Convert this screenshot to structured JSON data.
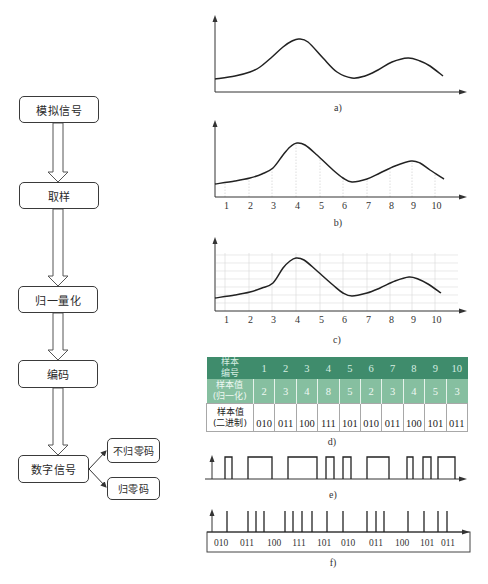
{
  "flowchart": {
    "steps": [
      {
        "label": "模拟信号"
      },
      {
        "label": "取样"
      },
      {
        "label": "归一量化"
      },
      {
        "label": "编码"
      },
      {
        "label": "数字信号"
      }
    ],
    "outputs": [
      {
        "label": "不归零码"
      },
      {
        "label": "归零码"
      }
    ]
  },
  "chart_data": [
    {
      "id": "a",
      "type": "line",
      "caption": "a)",
      "axes": {
        "origin": [
          215,
          92
        ],
        "y_top": 15,
        "x_end": 467
      },
      "curve": [
        [
          215,
          79
        ],
        [
          235,
          76
        ],
        [
          250,
          72
        ],
        [
          260,
          67
        ],
        [
          272,
          57
        ],
        [
          283,
          47
        ],
        [
          292,
          41
        ],
        [
          299,
          39
        ],
        [
          308,
          42
        ],
        [
          323,
          58
        ],
        [
          337,
          72
        ],
        [
          352,
          78
        ],
        [
          365,
          76
        ],
        [
          378,
          70
        ],
        [
          392,
          62
        ],
        [
          408,
          58
        ],
        [
          420,
          61
        ],
        [
          430,
          66
        ],
        [
          443,
          76
        ]
      ]
    },
    {
      "id": "b",
      "type": "line",
      "caption": "b)",
      "axes": {
        "origin": [
          215,
          197
        ],
        "y_top": 120,
        "x_end": 467
      },
      "x_ticks": [
        "1",
        "2",
        "3",
        "4",
        "5",
        "6",
        "7",
        "8",
        "9",
        "10"
      ],
      "x_tick_pos": [
        225,
        249,
        272,
        296,
        320,
        343,
        367,
        390,
        412,
        435
      ],
      "sample_lines": true,
      "grid": false,
      "curve": [
        [
          215,
          184
        ],
        [
          235,
          181
        ],
        [
          250,
          178
        ],
        [
          262,
          174
        ],
        [
          273,
          168
        ],
        [
          283,
          155
        ],
        [
          290,
          147
        ],
        [
          297,
          143
        ],
        [
          305,
          145
        ],
        [
          317,
          155
        ],
        [
          333,
          170
        ],
        [
          343,
          178
        ],
        [
          352,
          182
        ],
        [
          367,
          179
        ],
        [
          380,
          173
        ],
        [
          395,
          166
        ],
        [
          411,
          161
        ],
        [
          420,
          163
        ],
        [
          430,
          170
        ],
        [
          444,
          179
        ]
      ]
    },
    {
      "id": "c",
      "type": "line",
      "caption": "c)",
      "axes": {
        "origin": [
          215,
          311
        ],
        "y_top": 237,
        "x_end": 467
      },
      "x_ticks": [
        "1",
        "2",
        "3",
        "4",
        "5",
        "6",
        "7",
        "8",
        "9",
        "10"
      ],
      "x_tick_pos": [
        225,
        249,
        272,
        296,
        320,
        343,
        367,
        390,
        412,
        435
      ],
      "sample_lines": true,
      "grid": true,
      "curve": [
        [
          215,
          298
        ],
        [
          235,
          295
        ],
        [
          250,
          292
        ],
        [
          262,
          288
        ],
        [
          273,
          283
        ],
        [
          283,
          268
        ],
        [
          290,
          261
        ],
        [
          296,
          258
        ],
        [
          304,
          260
        ],
        [
          316,
          270
        ],
        [
          333,
          285
        ],
        [
          343,
          293
        ],
        [
          352,
          296
        ],
        [
          367,
          293
        ],
        [
          380,
          288
        ],
        [
          395,
          281
        ],
        [
          409,
          277
        ],
        [
          418,
          279
        ],
        [
          428,
          284
        ],
        [
          441,
          293
        ]
      ]
    },
    {
      "id": "d",
      "type": "table",
      "caption": "d)",
      "rows": [
        {
          "header": [
            "样本",
            "编号"
          ],
          "values": [
            "1",
            "2",
            "3",
            "4",
            "5",
            "6",
            "7",
            "8",
            "9",
            "10"
          ]
        },
        {
          "header": [
            "样本值",
            "(归一化)"
          ],
          "values": [
            "2",
            "3",
            "4",
            "8",
            "5",
            "2",
            "3",
            "4",
            "5",
            "3"
          ]
        },
        {
          "header": [
            "样本值",
            "(二进制)"
          ],
          "values": [
            "010",
            "011",
            "100",
            "111",
            "101",
            "010",
            "011",
            "100",
            "101",
            "011"
          ]
        }
      ]
    },
    {
      "id": "e",
      "type": "nrz_waveform",
      "caption": "e)",
      "axes": {
        "y_axis_x": 212,
        "baseline": 479,
        "high": 457,
        "x_start": 205,
        "x_end": 467
      },
      "pulses": [
        [
          225,
          232
        ],
        [
          248,
          272
        ],
        [
          288,
          317
        ],
        [
          326,
          334
        ],
        [
          343,
          351
        ],
        [
          367,
          389
        ],
        [
          407,
          413
        ],
        [
          423,
          431
        ],
        [
          438,
          455
        ]
      ]
    },
    {
      "id": "f",
      "type": "rz_impulses",
      "caption": "f)",
      "axes": {
        "y_axis_x": 212,
        "baseline": 532,
        "top": 511,
        "x_start": 207,
        "x_end": 470
      },
      "spikes": [
        227,
        248,
        256,
        264,
        285,
        293,
        302,
        312,
        327,
        343,
        367,
        376,
        384,
        408,
        424,
        438,
        447
      ],
      "codes": [
        "010",
        "011",
        "100",
        "111",
        "101",
        "010",
        "011",
        "100",
        "101",
        "011"
      ],
      "code_pos": [
        221,
        247,
        274,
        299,
        324,
        348,
        376,
        402,
        427,
        448
      ]
    }
  ]
}
